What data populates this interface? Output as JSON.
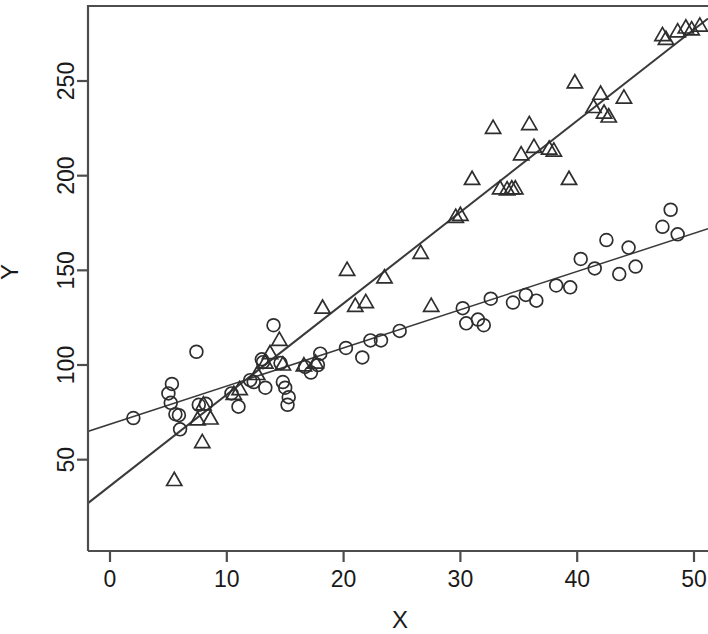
{
  "chart_data": {
    "type": "scatter",
    "title": "",
    "xlabel": "X",
    "ylabel": "Y",
    "xlim": [
      -2.1,
      51.2
    ],
    "ylim": [
      25.5,
      288.0
    ],
    "xticks": [
      0,
      10,
      20,
      30,
      40,
      50
    ],
    "xtick_labels": [
      "0",
      "10",
      "20",
      "30",
      "40",
      "50"
    ],
    "yticks": [
      50,
      100,
      150,
      200,
      250
    ],
    "ytick_labels": [
      "50",
      "100",
      "150",
      "200",
      "250"
    ],
    "grid": false,
    "legend": "none",
    "frame": "box",
    "marker_color": "#2e2e2e",
    "line_color": "#3a3a3a",
    "series": [
      {
        "name": "circles",
        "marker": "circle",
        "points": [
          [
            2.0,
            72.0
          ],
          [
            5.0,
            85.0
          ],
          [
            5.2,
            80.0
          ],
          [
            5.6,
            74.0
          ],
          [
            5.9,
            73.5
          ],
          [
            5.3,
            90.0
          ],
          [
            6.0,
            66.0
          ],
          [
            7.4,
            107.0
          ],
          [
            7.6,
            79.0
          ],
          [
            8.2,
            79.5
          ],
          [
            10.4,
            85.0
          ],
          [
            11.0,
            78.0
          ],
          [
            12.0,
            92.0
          ],
          [
            12.3,
            91.0
          ],
          [
            13.0,
            103.0
          ],
          [
            13.1,
            101.5
          ],
          [
            13.3,
            88.0
          ],
          [
            14.6,
            101.0
          ],
          [
            15.0,
            88.0
          ],
          [
            15.2,
            79.0
          ],
          [
            14.0,
            121.0
          ],
          [
            16.7,
            99.0
          ],
          [
            17.2,
            96.0
          ],
          [
            17.8,
            100.0
          ],
          [
            18.0,
            106.0
          ],
          [
            14.8,
            91.0
          ],
          [
            15.3,
            83.0
          ],
          [
            20.2,
            109.0
          ],
          [
            22.3,
            113.0
          ],
          [
            23.2,
            113.0
          ],
          [
            21.6,
            104.0
          ],
          [
            24.8,
            118.0
          ],
          [
            30.2,
            130.0
          ],
          [
            30.5,
            122.0
          ],
          [
            31.5,
            124.0
          ],
          [
            32.0,
            121.0
          ],
          [
            32.6,
            135.0
          ],
          [
            34.5,
            133.0
          ],
          [
            35.6,
            137.0
          ],
          [
            36.5,
            134.0
          ],
          [
            38.2,
            142.0
          ],
          [
            39.4,
            141.0
          ],
          [
            40.3,
            156.0
          ],
          [
            41.5,
            151.0
          ],
          [
            42.5,
            166.0
          ],
          [
            43.6,
            148.0
          ],
          [
            44.4,
            162.0
          ],
          [
            45.0,
            152.0
          ],
          [
            47.3,
            173.0
          ],
          [
            48.0,
            182.0
          ],
          [
            48.6,
            169.0
          ]
        ]
      },
      {
        "name": "triangles",
        "marker": "triangle",
        "points": [
          [
            5.5,
            39.0
          ],
          [
            7.9,
            59.0
          ],
          [
            7.5,
            71.0
          ],
          [
            8.0,
            79.0
          ],
          [
            8.6,
            71.5
          ],
          [
            10.6,
            84.5
          ],
          [
            11.1,
            87.0
          ],
          [
            12.6,
            95.0
          ],
          [
            13.3,
            101.0
          ],
          [
            13.7,
            106.0
          ],
          [
            14.5,
            113.0
          ],
          [
            14.8,
            100.0
          ],
          [
            16.6,
            99.5
          ],
          [
            17.6,
            101.0
          ],
          [
            18.2,
            130.0
          ],
          [
            20.3,
            150.0
          ],
          [
            21.0,
            131.0
          ],
          [
            21.9,
            133.0
          ],
          [
            23.5,
            146.0
          ],
          [
            26.6,
            159.0
          ],
          [
            27.5,
            131.0
          ],
          [
            29.6,
            178.0
          ],
          [
            30.0,
            179.0
          ],
          [
            31.0,
            198.0
          ],
          [
            32.8,
            225.0
          ],
          [
            33.4,
            193.0
          ],
          [
            34.0,
            192.5
          ],
          [
            34.4,
            193.0
          ],
          [
            34.7,
            193.0
          ],
          [
            35.2,
            211.0
          ],
          [
            35.9,
            227.0
          ],
          [
            36.3,
            215.0
          ],
          [
            37.6,
            214.0
          ],
          [
            38.0,
            213.0
          ],
          [
            39.3,
            198.0
          ],
          [
            39.8,
            249.0
          ],
          [
            41.4,
            236.0
          ],
          [
            42.0,
            243.0
          ],
          [
            42.3,
            233.0
          ],
          [
            42.7,
            231.0
          ],
          [
            44.0,
            241.0
          ],
          [
            47.3,
            274.0
          ],
          [
            47.6,
            272.0
          ],
          [
            48.6,
            276.0
          ],
          [
            49.3,
            278.0
          ],
          [
            49.8,
            277.0
          ],
          [
            50.5,
            279.0
          ]
        ]
      }
    ],
    "fit_lines": [
      {
        "name": "circle-fit",
        "x0": -2.1,
        "y0": 64.5,
        "x1": 51.2,
        "y1": 172.0
      },
      {
        "name": "triangle-fit",
        "x0": -2.1,
        "y0": 26.0,
        "x1": 51.2,
        "y1": 283.0
      }
    ]
  }
}
